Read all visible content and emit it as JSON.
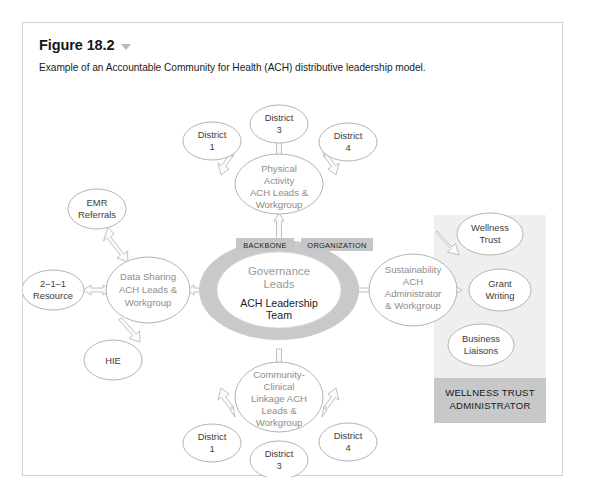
{
  "figure": {
    "title": "Figure 18.2",
    "caret_icon": "chevron-down-icon",
    "caption": "Example of an Accountable Community for Health (ACH) distributive leadership model."
  },
  "diagram": {
    "core": {
      "governance_label": "Governance\nLeads",
      "governance_line1": "Governance",
      "governance_line2": "Leads",
      "leadership_line1": "ACH Leadership",
      "leadership_line2": "Team",
      "ring_color": "#c9c9c9"
    },
    "tags": [
      {
        "id": "backbone",
        "label": "BACKBONE"
      },
      {
        "id": "organization",
        "label": "ORGANIZATION"
      }
    ],
    "hubs": [
      {
        "id": "physical-activity",
        "lines": [
          "Physical",
          "Activity",
          "ACH Leads &",
          "Workgroup"
        ],
        "position": "top"
      },
      {
        "id": "data-sharing",
        "lines": [
          "Data Sharing",
          "ACH Leads &",
          "Workgroup"
        ],
        "position": "left"
      },
      {
        "id": "sustainability",
        "lines": [
          "Sustainability",
          "ACH",
          "Administrator",
          "& Workgroup"
        ],
        "position": "right"
      },
      {
        "id": "community-clinical-linkage",
        "lines": [
          "Community-",
          "Clinical",
          "Linkage ACH",
          "Leads &",
          "Workgroup"
        ],
        "position": "bottom"
      }
    ],
    "leaf_nodes": [
      {
        "id": "top-district-1",
        "lines": [
          "District",
          "1"
        ]
      },
      {
        "id": "top-district-3",
        "lines": [
          "District",
          "3"
        ]
      },
      {
        "id": "top-district-4",
        "lines": [
          "District",
          "4"
        ]
      },
      {
        "id": "emr-referrals",
        "lines": [
          "EMR",
          "Referrals"
        ]
      },
      {
        "id": "resource-211",
        "lines": [
          "2–1–1",
          "Resource"
        ]
      },
      {
        "id": "hie",
        "lines": [
          "HIE"
        ]
      },
      {
        "id": "wellness-trust",
        "lines": [
          "Wellness",
          "Trust"
        ]
      },
      {
        "id": "grant-writing",
        "lines": [
          "Grant",
          "Writing"
        ]
      },
      {
        "id": "business-liaisons",
        "lines": [
          "Business",
          "Liaisons"
        ]
      },
      {
        "id": "bottom-district-1",
        "lines": [
          "District",
          "1"
        ]
      },
      {
        "id": "bottom-district-3",
        "lines": [
          "District",
          "3"
        ]
      },
      {
        "id": "bottom-district-4",
        "lines": [
          "District",
          "4"
        ]
      }
    ],
    "panel": {
      "label_line1": "WELLNESS TRUST",
      "label_line2": "ADMINISTRATOR",
      "background_color": "#efefef",
      "label_background_color": "#c8c8c8"
    }
  }
}
